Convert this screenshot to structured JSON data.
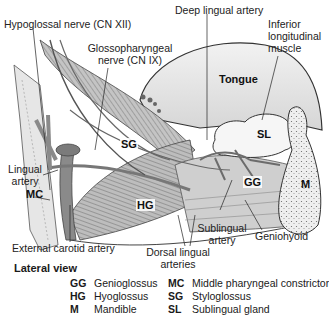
{
  "figure": {
    "title": "Lateral view",
    "colors": {
      "tongue": "#e4e4e4",
      "muscle": "#b5b5b5",
      "muscle_lines": "#7a7a7a",
      "artery": "#8a8a8a",
      "artery_dark": "#5e5e5e",
      "gland": "#f4f4f4",
      "bone": "#efefef",
      "outline": "#333333"
    },
    "structure_labels": {
      "tongue": "Tongue",
      "sg": "SG",
      "hg": "HG",
      "sl": "SL",
      "gg": "GG",
      "m": "M",
      "mc": "MC"
    },
    "callouts": {
      "hypoglossal": "Hypoglossal nerve (CN XII)",
      "glossopharyngeal_1": "Glossopharyngeal",
      "glossopharyngeal_2": "nerve (CN IX)",
      "deep_lingual": "Deep lingual artery",
      "inferior_longitudinal_1": "Inferior",
      "inferior_longitudinal_2": "longitudinal",
      "inferior_longitudinal_3": "muscle",
      "lingual_artery_1": "Lingual",
      "lingual_artery_2": "artery",
      "external_carotid": "External carotid artery",
      "sublingual_artery_1": "Sublingual",
      "sublingual_artery_2": "artery",
      "geniohyoid": "Geniohyoid",
      "dorsal_lingual_1": "Dorsal lingual",
      "dorsal_lingual_2": "arteries"
    }
  },
  "legend": [
    {
      "abbr": "GG",
      "name": "Genioglossus"
    },
    {
      "abbr": "HG",
      "name": "Hyoglossus"
    },
    {
      "abbr": "M",
      "name": "Mandible"
    },
    {
      "abbr": "MC",
      "name": "Middle pharyngeal constrictor"
    },
    {
      "abbr": "SG",
      "name": "Styloglossus"
    },
    {
      "abbr": "SL",
      "name": "Sublingual gland"
    }
  ]
}
